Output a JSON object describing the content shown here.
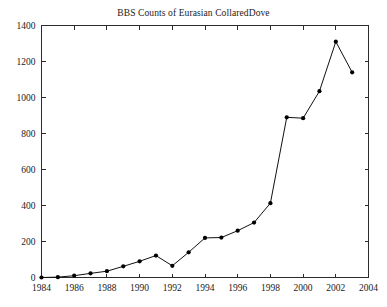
{
  "chart_data": {
    "type": "line",
    "title": "BBS Counts of Eurasian CollaredDove",
    "xlabel": "",
    "ylabel": "",
    "x": [
      1984,
      1985,
      1986,
      1987,
      1988,
      1989,
      1990,
      1991,
      1992,
      1993,
      1994,
      1995,
      1996,
      1997,
      1998,
      1999,
      2000,
      2001,
      2002,
      2003
    ],
    "values": [
      0,
      2,
      10,
      23,
      35,
      62,
      90,
      122,
      65,
      140,
      220,
      222,
      260,
      305,
      413,
      890,
      885,
      1035,
      1310,
      1140
    ],
    "series": [
      {
        "name": "BBS Counts",
        "values": [
          0,
          2,
          10,
          23,
          35,
          62,
          90,
          122,
          65,
          140,
          220,
          222,
          260,
          305,
          413,
          890,
          885,
          1035,
          1310,
          1140
        ]
      }
    ],
    "xlim": [
      1984,
      2004
    ],
    "ylim": [
      0,
      1400
    ],
    "xticks": [
      1984,
      1986,
      1988,
      1990,
      1992,
      1994,
      1996,
      1998,
      2000,
      2002,
      2004
    ],
    "xtick_labels": [
      "1984",
      "1986",
      "1988",
      "1990",
      "1992",
      "1994",
      "1996",
      "1998",
      "2000",
      "2002",
      "2004"
    ],
    "yticks": [
      0,
      200,
      400,
      600,
      800,
      1000,
      1200,
      1400
    ],
    "ytick_labels": [
      "0",
      "200",
      "400",
      "600",
      "800",
      "1000",
      "1200",
      "1400"
    ],
    "grid": false,
    "legend": null,
    "marker": "filled-circle",
    "line_color": "#111111",
    "marker_color": "#000000",
    "axis_color": "#2b2b2b",
    "background_color": "#ffffff"
  }
}
